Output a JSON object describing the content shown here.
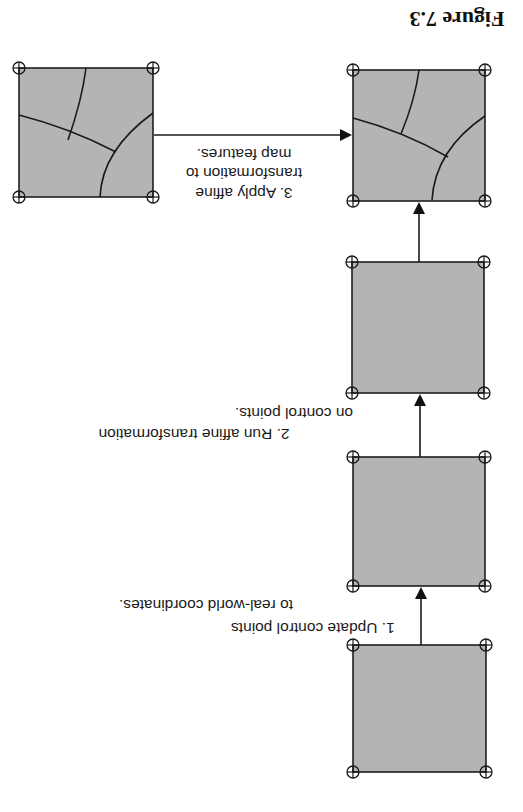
{
  "figure": {
    "title": "Figure 7.3",
    "orientation": "rotated 180 degrees",
    "colors": {
      "background": "#ffffff",
      "box_fill": "#b4b4b4",
      "stroke": "#1a1a1a"
    }
  },
  "steps": [
    {
      "id": "step-1",
      "line1": "1. Update control points",
      "line2": "to real-world coordinates."
    },
    {
      "id": "step-2",
      "line1": "2. Run affine transformation",
      "line2": "on control points."
    },
    {
      "id": "step-3",
      "line1": "3. Apply affine",
      "line2": "transformation to",
      "line3": "map features."
    }
  ],
  "nodes": [
    {
      "id": "box-initial",
      "has_map_features": false
    },
    {
      "id": "box-updated-control-points",
      "has_map_features": false
    },
    {
      "id": "box-transformed-control-points",
      "has_map_features": false
    },
    {
      "id": "box-transformed-map",
      "has_map_features": true
    },
    {
      "id": "box-source-map",
      "has_map_features": true
    }
  ],
  "legend": {
    "control_point_icon": "crosshair-circle-icon"
  }
}
